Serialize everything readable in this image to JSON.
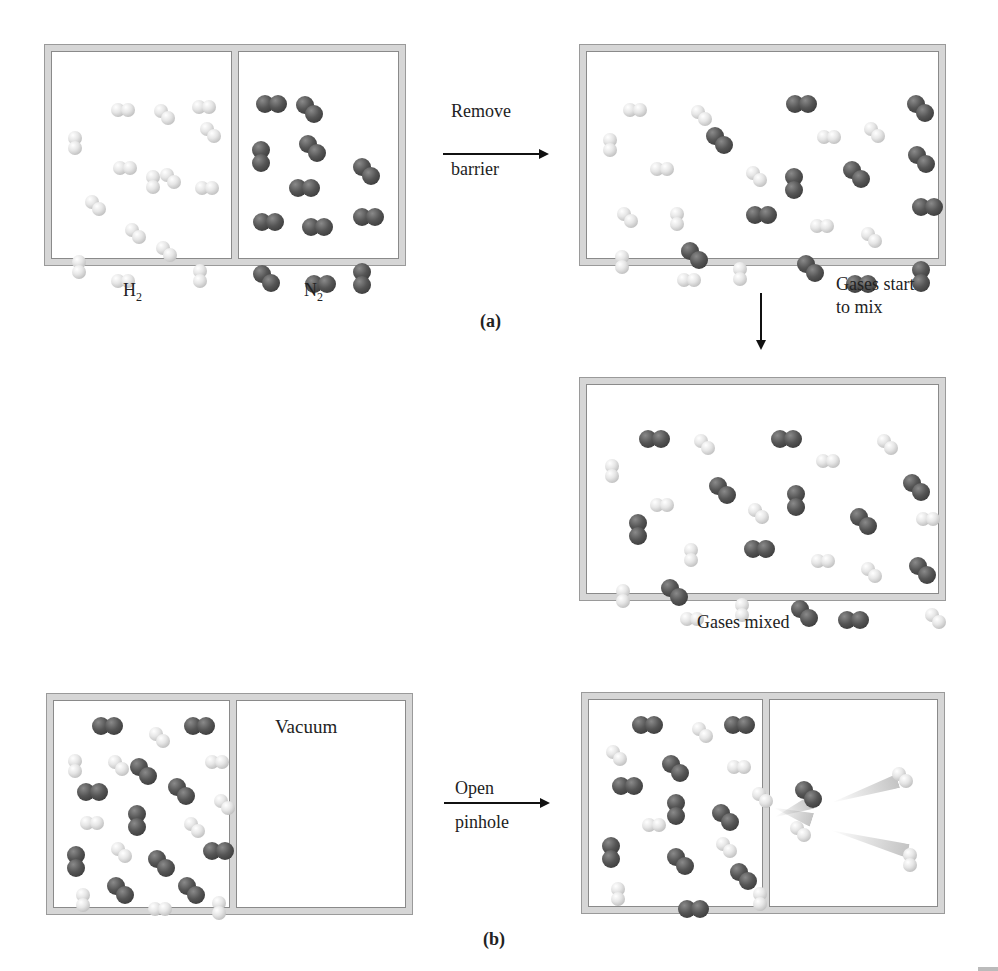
{
  "figure": {
    "panel_a": {
      "label": "(a)",
      "initial": {
        "left_gas_label": "H",
        "left_gas_sub": "2",
        "right_gas_label": "N",
        "right_gas_sub": "2",
        "h2": [
          [
            68,
            60,
            "h"
          ],
          [
            111,
            61,
            "d"
          ],
          [
            149,
            57,
            "h"
          ],
          [
            25,
            88,
            "v"
          ],
          [
            157,
            79,
            "d"
          ],
          [
            70,
            118,
            "h"
          ],
          [
            103,
            127,
            "v"
          ],
          [
            117,
            125,
            "d"
          ],
          [
            42,
            152,
            "d"
          ],
          [
            152,
            138,
            "h"
          ],
          [
            82,
            180,
            "d"
          ],
          [
            113,
            198,
            "d"
          ],
          [
            29,
            212,
            "v"
          ],
          [
            68,
            231,
            "h"
          ],
          [
            150,
            221,
            "v"
          ]
        ],
        "n2": [
          [
            213,
            52,
            "h"
          ],
          [
            253,
            53,
            "d"
          ],
          [
            209,
            98,
            "v"
          ],
          [
            256,
            92,
            "d"
          ],
          [
            246,
            136,
            "h"
          ],
          [
            310,
            115,
            "d"
          ],
          [
            210,
            170,
            "h"
          ],
          [
            259,
            175,
            "h"
          ],
          [
            210,
            222,
            "d"
          ],
          [
            262,
            232,
            "h"
          ],
          [
            310,
            165,
            "h"
          ],
          [
            310,
            220,
            "v"
          ]
        ]
      },
      "arrow_label_top": "Remove",
      "arrow_label_bottom": "barrier",
      "mixing": {
        "h2": [
          [
            45,
            60,
            "h"
          ],
          [
            113,
            62,
            "d"
          ],
          [
            25,
            90,
            "v"
          ],
          [
            239,
            87,
            "h"
          ],
          [
            286,
            79,
            "d"
          ],
          [
            72,
            119,
            "h"
          ],
          [
            168,
            123,
            "d"
          ],
          [
            92,
            164,
            "v"
          ],
          [
            39,
            164,
            "d"
          ],
          [
            232,
            176,
            "h"
          ],
          [
            283,
            184,
            "d"
          ],
          [
            37,
            207,
            "v"
          ],
          [
            99,
            230,
            "h"
          ],
          [
            155,
            219,
            "v"
          ]
        ],
        "n2": [
          [
            208,
            52,
            "h"
          ],
          [
            329,
            52,
            "d"
          ],
          [
            128,
            84,
            "d"
          ],
          [
            207,
            125,
            "v"
          ],
          [
            265,
            118,
            "d"
          ],
          [
            330,
            103,
            "d"
          ],
          [
            334,
            155,
            "h"
          ],
          [
            168,
            163,
            "h"
          ],
          [
            103,
            199,
            "d"
          ],
          [
            219,
            212,
            "d"
          ],
          [
            268,
            232,
            "h"
          ],
          [
            334,
            218,
            "v"
          ]
        ]
      },
      "transition_label_line1": "Gases start",
      "transition_label_line2": "to mix",
      "mixed": {
        "caption": "Gases mixed",
        "h2": [
          [
            116,
            58,
            "d"
          ],
          [
            27,
            83,
            "v"
          ],
          [
            238,
            78,
            "h"
          ],
          [
            299,
            58,
            "d"
          ],
          [
            72,
            122,
            "h"
          ],
          [
            170,
            127,
            "d"
          ],
          [
            106,
            167,
            "v"
          ],
          [
            338,
            136,
            "h"
          ],
          [
            233,
            178,
            "h"
          ],
          [
            283,
            186,
            "d"
          ],
          [
            38,
            208,
            "v"
          ],
          [
            102,
            236,
            "h"
          ],
          [
            157,
            222,
            "v"
          ],
          [
            347,
            232,
            "d"
          ]
        ],
        "n2": [
          [
            61,
            54,
            "h"
          ],
          [
            193,
            54,
            "h"
          ],
          [
            131,
            101,
            "d"
          ],
          [
            209,
            109,
            "v"
          ],
          [
            272,
            132,
            "d"
          ],
          [
            325,
            98,
            "d"
          ],
          [
            51,
            138,
            "v"
          ],
          [
            166,
            164,
            "h"
          ],
          [
            331,
            181,
            "d"
          ],
          [
            83,
            203,
            "d"
          ],
          [
            213,
            224,
            "d"
          ],
          [
            260,
            235,
            "h"
          ]
        ]
      }
    },
    "panel_b": {
      "label": "(b)",
      "sealed": {
        "vacuum_label": "Vacuum",
        "h2": [
          [
            104,
            35,
            "d"
          ],
          [
            23,
            62,
            "v"
          ],
          [
            63,
            63,
            "d"
          ],
          [
            160,
            63,
            "h"
          ],
          [
            169,
            102,
            "d"
          ],
          [
            35,
            124,
            "h"
          ],
          [
            139,
            125,
            "d"
          ],
          [
            66,
            150,
            "d"
          ],
          [
            31,
            196,
            "v"
          ],
          [
            103,
            210,
            "h"
          ],
          [
            167,
            204,
            "v"
          ]
        ],
        "n2": [
          [
            47,
            25,
            "h"
          ],
          [
            139,
            25,
            "h"
          ],
          [
            85,
            66,
            "d"
          ],
          [
            123,
            86,
            "d"
          ],
          [
            32,
            91,
            "h"
          ],
          [
            83,
            113,
            "v"
          ],
          [
            22,
            154,
            "v"
          ],
          [
            103,
            158,
            "d"
          ],
          [
            158,
            150,
            "h"
          ],
          [
            62,
            185,
            "d"
          ],
          [
            133,
            185,
            "d"
          ]
        ]
      },
      "arrow_label_top": "Open",
      "arrow_label_bottom": "pinhole",
      "effusing": {
        "h2": [
          [
            112,
            31,
            "d"
          ],
          [
            26,
            54,
            "d"
          ],
          [
            147,
            69,
            "h"
          ],
          [
            172,
            96,
            "d"
          ],
          [
            62,
            127,
            "h"
          ],
          [
            136,
            146,
            "d"
          ],
          [
            31,
            191,
            "v"
          ],
          [
            173,
            196,
            "v"
          ],
          [
            210,
            130,
            "d"
          ],
          [
            312,
            76,
            "d"
          ],
          [
            323,
            157,
            "v"
          ]
        ],
        "n2": [
          [
            52,
            25,
            "h"
          ],
          [
            144,
            25,
            "h"
          ],
          [
            82,
            64,
            "d"
          ],
          [
            32,
            86,
            "h"
          ],
          [
            87,
            103,
            "v"
          ],
          [
            132,
            113,
            "d"
          ],
          [
            22,
            146,
            "v"
          ],
          [
            87,
            157,
            "d"
          ],
          [
            150,
            172,
            "d"
          ],
          [
            98,
            209,
            "h"
          ],
          [
            215,
            90,
            "d"
          ]
        ]
      }
    }
  }
}
